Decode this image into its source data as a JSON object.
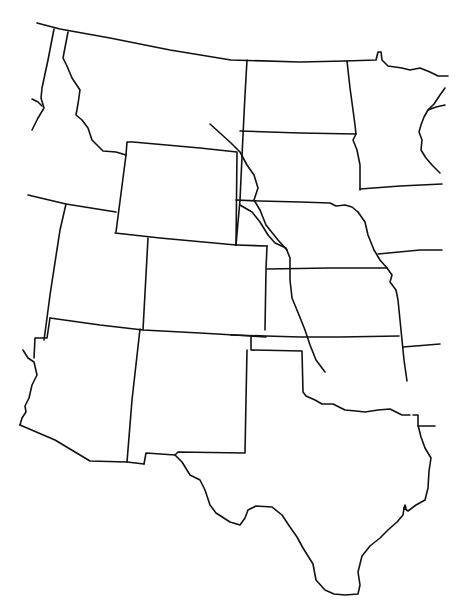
{
  "map": {
    "title": "",
    "type": "outline-map",
    "region": "Western and Central United States (blank outline)",
    "background_color": "#ffffff",
    "line_color": "#111111",
    "labels": [],
    "features": {
      "states": [
        "Montana",
        "Idaho",
        "Wyoming",
        "North Dakota",
        "South Dakota",
        "Minnesota",
        "Nebraska",
        "Iowa",
        "Utah",
        "Colorado",
        "Kansas",
        "Missouri",
        "Arizona",
        "New Mexico",
        "Oklahoma",
        "Arkansas",
        "Texas",
        "Louisiana"
      ],
      "rivers": [
        "Missouri River",
        "Platte River"
      ]
    }
  }
}
